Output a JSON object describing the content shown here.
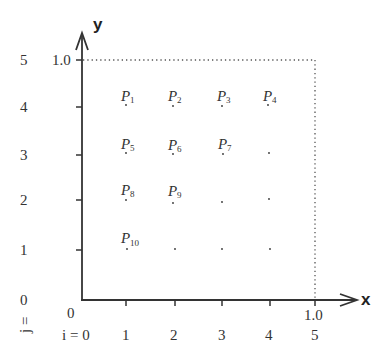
{
  "diagram": {
    "axes": {
      "x_label": "x",
      "y_label": "y",
      "origin_label": "0",
      "x_max_label": "1.0",
      "y_max_label": "1.0"
    },
    "i_index": {
      "prefix": "i = 0",
      "labels": [
        "1",
        "2",
        "3",
        "4",
        "5"
      ]
    },
    "j_index": {
      "prefix": "j =",
      "labels": [
        "0",
        "1",
        "2",
        "3",
        "4",
        "5"
      ]
    },
    "points": [
      {
        "label": "P",
        "sub": "1",
        "i": 1,
        "j": 4
      },
      {
        "label": "P",
        "sub": "2",
        "i": 2,
        "j": 4
      },
      {
        "label": "P",
        "sub": "3",
        "i": 3,
        "j": 4
      },
      {
        "label": "P",
        "sub": "4",
        "i": 4,
        "j": 4
      },
      {
        "label": "P",
        "sub": "5",
        "i": 1,
        "j": 3
      },
      {
        "label": "P",
        "sub": "6",
        "i": 2,
        "j": 3
      },
      {
        "label": "P",
        "sub": "7",
        "i": 3,
        "j": 3
      },
      {
        "label": "P",
        "sub": "8",
        "i": 1,
        "j": 2
      },
      {
        "label": "P",
        "sub": "9",
        "i": 2,
        "j": 2
      },
      {
        "label": "P",
        "sub": "10",
        "i": 1,
        "j": 1
      }
    ],
    "unlabeled_points": [
      {
        "i": 4,
        "j": 3
      },
      {
        "i": 3,
        "j": 2
      },
      {
        "i": 4,
        "j": 2
      },
      {
        "i": 2,
        "j": 1
      },
      {
        "i": 3,
        "j": 1
      },
      {
        "i": 4,
        "j": 1
      }
    ],
    "colors": {
      "axis": "#333333",
      "text": "#333333",
      "dotted": "#555555"
    }
  }
}
